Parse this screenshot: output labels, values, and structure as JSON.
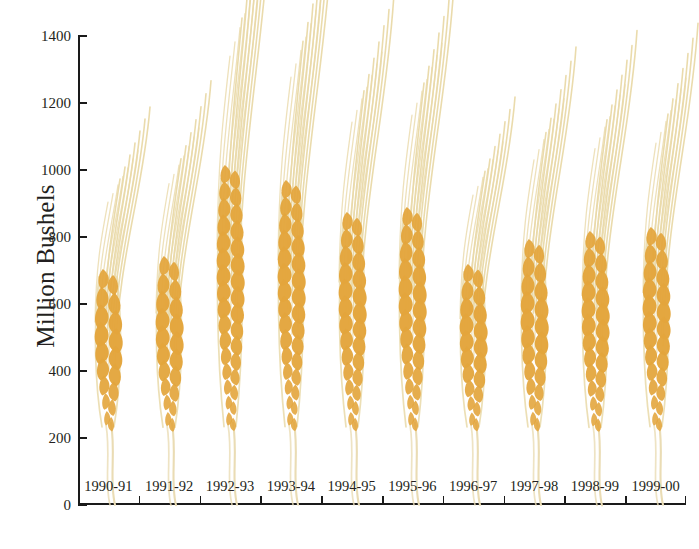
{
  "chart_data": {
    "type": "bar",
    "title": "",
    "subtitle": "",
    "xlabel": "",
    "ylabel": "Million Bushels",
    "categories": [
      "1990-91",
      "1991-92",
      "1992-93",
      "1993-94",
      "1994-95",
      "1995-96",
      "1996-97",
      "1997-98",
      "1998-99",
      "1999-00"
    ],
    "values": [
      710,
      750,
      1020,
      975,
      880,
      895,
      725,
      800,
      825,
      835
    ],
    "series": [
      {
        "name": "Million Bushels",
        "values": [
          710,
          750,
          1020,
          975,
          880,
          895,
          725,
          800,
          825,
          835
        ]
      }
    ],
    "ylim": [
      0,
      1400
    ],
    "ytick_values": [
      0,
      200,
      400,
      600,
      800,
      1000,
      1200,
      1400
    ],
    "ytick_labels": [
      "0",
      "200",
      "400",
      "600",
      "800",
      "1000",
      "1200",
      "1400"
    ],
    "grid": false,
    "legend": false,
    "legend_position": "none",
    "marker_style": "wheat-stalk-pictogram",
    "colors": {
      "grain": "#e3a53c",
      "grain_light": "#edbb62",
      "awn": "#e9d9a8",
      "stem": "#eadcb4",
      "axis": "#1a1a1a",
      "text": "#231f20",
      "background": "#ffffff"
    }
  },
  "axis": {
    "y_title": "Million Bushels"
  }
}
